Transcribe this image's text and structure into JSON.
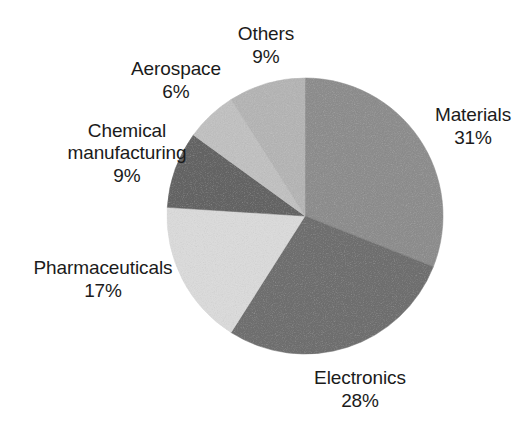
{
  "figure": {
    "background_color": "#ffffff",
    "text_color": "#1b1b1b"
  },
  "chart_data": {
    "type": "pie",
    "title": "",
    "subtitle": "",
    "xlabel": "",
    "ylabel": "",
    "legend_position": "none",
    "grid": false,
    "label_format": "name above percentage",
    "start_angle_deg": 0,
    "direction": "clockwise",
    "center": {
      "x": 305,
      "y": 216,
      "radius": 138
    },
    "categories": [
      "Materials",
      "Electronics",
      "Pharmaceuticals",
      "Chemical manufacturing",
      "Aerospace",
      "Others"
    ],
    "values": [
      31,
      28,
      17,
      9,
      6,
      9
    ],
    "value_labels": [
      "31%",
      "28%",
      "17%",
      "9%",
      "6%",
      "9%"
    ],
    "unit": "%",
    "total": 100,
    "slices": [
      {
        "name": "Materials",
        "value": 31,
        "value_label": "31%",
        "color": "#8d8d8d",
        "start_deg": 0,
        "end_deg": 111.6,
        "label_position": "right"
      },
      {
        "name": "Electronics",
        "value": 28,
        "value_label": "28%",
        "color": "#6f6f6f",
        "start_deg": 111.6,
        "end_deg": 212.4,
        "label_position": "bottom"
      },
      {
        "name": "Pharmaceuticals",
        "value": 17,
        "value_label": "17%",
        "color": "#d9d9d9",
        "start_deg": 212.4,
        "end_deg": 273.6,
        "label_position": "left"
      },
      {
        "name": "Chemical manufacturing",
        "value": 9,
        "value_label": "9%",
        "color": "#646464",
        "start_deg": 273.6,
        "end_deg": 306.0,
        "label_position": "upper-left"
      },
      {
        "name": "Aerospace",
        "value": 6,
        "value_label": "6%",
        "color": "#c0c0c0",
        "start_deg": 306.0,
        "end_deg": 327.6,
        "label_position": "top-left"
      },
      {
        "name": "Others",
        "value": 9,
        "value_label": "9%",
        "color": "#b4b4b4",
        "start_deg": 327.6,
        "end_deg": 360.0,
        "label_position": "top"
      }
    ]
  },
  "labels": {
    "others": {
      "name": "Others",
      "value": "9%"
    },
    "aerospace": {
      "name": "Aerospace",
      "value": "6%"
    },
    "chemical": {
      "name_line1": "Chemical",
      "name_line2": "manufacturing",
      "value": "9%"
    },
    "pharma": {
      "name": "Pharmaceuticals",
      "value": "17%"
    },
    "electronics": {
      "name": "Electronics",
      "value": "28%"
    },
    "materials": {
      "name": "Materials",
      "value": "31%"
    }
  }
}
